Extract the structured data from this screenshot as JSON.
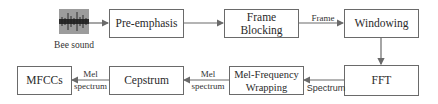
{
  "diagram": {
    "input": {
      "label": "Bee sound",
      "icon": "waveform-icon"
    },
    "nodes": [
      {
        "id": "pre_emphasis",
        "label": "Pre-emphasis"
      },
      {
        "id": "frame_blocking",
        "label": "Frame\nBlocking"
      },
      {
        "id": "windowing",
        "label": "Windowing"
      },
      {
        "id": "fft",
        "label": "FFT"
      },
      {
        "id": "mel_wrapping",
        "label": "Mel-Frequency\nWrapping"
      },
      {
        "id": "cepstrum",
        "label": "Cepstrum"
      },
      {
        "id": "mfccs",
        "label": "MFCCs"
      }
    ],
    "edge_labels": {
      "frame": "Frame",
      "spectrum": "Spectrum",
      "mel_spectrum_1_line1": "Mel",
      "mel_spectrum_1_line2": "spectrum",
      "mel_spectrum_2_line1": "Mel",
      "mel_spectrum_2_line2": "spectrum"
    },
    "colors": {
      "stroke": "#6a6a6a",
      "text": "#2a2a2a",
      "waveform_bg": "#9c9c9c"
    }
  }
}
